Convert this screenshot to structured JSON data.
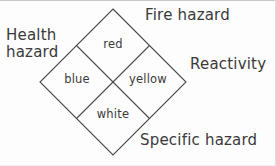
{
  "diagram": {
    "line_color": "#4a4a4a",
    "text_color": "#3a3a3a",
    "background_color": "#fdfdfd",
    "geometry": {
      "center_x": 113,
      "center_y": 82,
      "half_width": 73,
      "half_height": 73,
      "top_vertex": "113,9",
      "left_vertex": "40,82",
      "right_vertex": "186,82",
      "bottom_vertex": "113,155"
    },
    "outer_labels": [
      {
        "name": "health-hazard",
        "line1": "Health",
        "line2": "hazard",
        "position": "left"
      },
      {
        "name": "fire-hazard",
        "line1": "Fire hazard",
        "line2": "",
        "position": "top-right"
      },
      {
        "name": "reactivity",
        "line1": "Reactivity",
        "line2": "",
        "position": "right"
      },
      {
        "name": "specific-hazard",
        "line1": "Specific hazard",
        "line2": "",
        "position": "bottom-right"
      }
    ],
    "quadrants": [
      {
        "name": "top-quadrant",
        "label": "red",
        "meaning": "Fire hazard"
      },
      {
        "name": "left-quadrant",
        "label": "blue",
        "meaning": "Health hazard"
      },
      {
        "name": "right-quadrant",
        "label": "yellow",
        "meaning": "Reactivity"
      },
      {
        "name": "bottom-quadrant",
        "label": "white",
        "meaning": "Specific hazard"
      }
    ]
  }
}
